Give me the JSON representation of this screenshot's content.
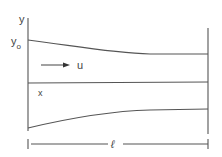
{
  "diagram": {
    "type": "channel-flow-schematic",
    "labels": {
      "y_axis": "y",
      "y0_main": "y",
      "y0_sub": "o",
      "x_axis": "x",
      "velocity": "u",
      "length": "ℓ"
    },
    "colors": {
      "line": "#555555",
      "text": "#444444",
      "background": "#ffffff"
    }
  }
}
